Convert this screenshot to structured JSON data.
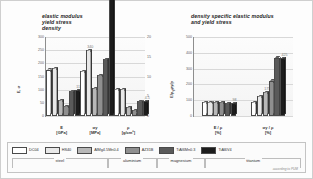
{
  "figure": {
    "source_note": "according to PUM"
  },
  "panels": {
    "left": {
      "title": "elastic modulus\nyield stress\ndensity",
      "y_axis_label": "E, σ",
      "y_axis_label_secondary": "ρ",
      "y_ticks": [
        "300",
        "250",
        "200",
        "150",
        "100",
        "50",
        "0"
      ],
      "y_ticks_secondary": [
        "20",
        "15",
        "10",
        "5",
        "0"
      ],
      "x_labels": [
        "E\n[GPa]",
        "σy\n[MPa]",
        "ρ\n[g/cm³]"
      ]
    },
    "right": {
      "title": "density specific elastic modulus\nand yield stress",
      "y_axis_label": "E/ρ, σy/ρ",
      "y_ticks": [
        "500",
        "400",
        "300",
        "200",
        "100",
        "0"
      ],
      "x_labels": [
        "E / ρ\n[%]",
        "σy / ρ\n[%]"
      ]
    }
  },
  "legend": {
    "items": [
      {
        "label": "DC04",
        "color": "#ffffff"
      },
      {
        "label": "HS40",
        "color": "#e8e8e8"
      },
      {
        "label": "AlMg4.5Mn0.4",
        "color": "#b8b8b8"
      },
      {
        "label": "AZ31B",
        "color": "#8f8f8f"
      },
      {
        "label": "TiAl6Mn0.3",
        "color": "#5a5a5a"
      },
      {
        "label": "TiAl6V4",
        "color": "#1c1c1c"
      }
    ],
    "material_groups": [
      {
        "label": "steel",
        "span": 2
      },
      {
        "label": "aluminium",
        "span": 1
      },
      {
        "label": "magnesium",
        "span": 1
      },
      {
        "label": "titanium",
        "span": 2
      }
    ]
  },
  "chart_data": [
    {
      "type": "bar",
      "title": "elastic modulus / yield stress / density",
      "xlabel": "",
      "ylabel": "E, σ",
      "ylim": [
        0,
        300
      ],
      "ylim_secondary": [
        0,
        20
      ],
      "grid": true,
      "legend_position": "bottom",
      "categories": [
        "E [GPa]",
        "σy [MPa]",
        "ρ [g/cm³]"
      ],
      "series": [
        {
          "name": "DC04",
          "values": [
            205,
            200,
            7.85
          ]
        },
        {
          "name": "HS40",
          "values": [
            210,
            290,
            7.85
          ]
        },
        {
          "name": "AlMg4.5Mn0.4",
          "values": [
            70,
            125,
            2.7
          ]
        },
        {
          "name": "AZ31B",
          "values": [
            45,
            180,
            1.75
          ]
        },
        {
          "name": "TiAl6Mn0.3",
          "values": [
            110,
            250,
            4.5
          ]
        },
        {
          "name": "TiAl6V4",
          "values": [
            113,
            890,
            4.43
          ]
        }
      ],
      "annotations": [
        {
          "series": "TiAl6V4",
          "category": "E [GPa]",
          "text": "113"
        },
        {
          "series": "HS40",
          "category": "σy [MPa]",
          "text": "340"
        },
        {
          "series": "TiAl6V4",
          "category": "σy [MPa]",
          "text": "890"
        },
        {
          "series": "TiAl6V4",
          "category": "ρ [g/cm³]",
          "text": "4.5"
        }
      ]
    },
    {
      "type": "bar",
      "title": "density specific elastic modulus and yield stress",
      "xlabel": "",
      "ylabel": "E/ρ, σy/ρ",
      "ylim": [
        0,
        500
      ],
      "grid": true,
      "legend_position": "bottom",
      "categories": [
        "E / ρ [%]",
        "σy / ρ [%]"
      ],
      "series": [
        {
          "name": "DC04",
          "values": [
            100,
            100
          ]
        },
        {
          "name": "HS40",
          "values": [
            100,
            145
          ]
        },
        {
          "name": "AlMg4.5Mn0.4",
          "values": [
            100,
            175
          ]
        },
        {
          "name": "AZ31B",
          "values": [
            100,
            260
          ]
        },
        {
          "name": "TiAl6Mn0.3",
          "values": [
            98,
            430
          ]
        },
        {
          "name": "TiAl6V4",
          "values": [
            98,
            425
          ]
        }
      ],
      "annotations": [
        {
          "series": "TiAl6V4",
          "category": "E / ρ [%]",
          "text": "98"
        },
        {
          "series": "AlMg4.5Mn0.4",
          "category": "σy / ρ [%]",
          "text": "175"
        },
        {
          "series": "TiAl6V4",
          "category": "σy / ρ [%]",
          "text": "425"
        }
      ]
    }
  ]
}
